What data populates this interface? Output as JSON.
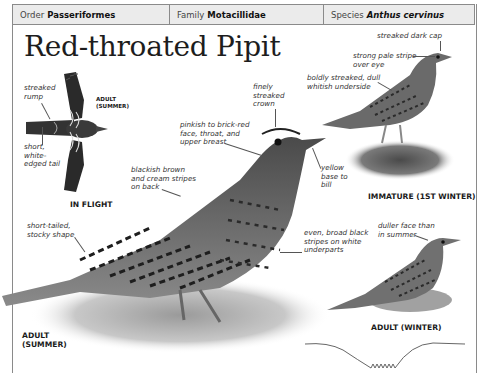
{
  "header": {
    "order_label": "Order",
    "order_value": "Passeriformes",
    "family_label": "Family",
    "family_value": "Motacillidae",
    "species_label": "Species",
    "species_value": "Anthus cervinus"
  },
  "title": "Red-throated Pipit",
  "flight_figure": {
    "caption": "IN FLIGHT",
    "age_label_line1": "ADULT",
    "age_label_line2": "(SUMMER)",
    "annotations": [
      {
        "line1": "streaked",
        "line2": "rump"
      },
      {
        "line1": "short,",
        "line2": "white-",
        "line3": "edged tail"
      }
    ]
  },
  "main_figure": {
    "caption_line1": "ADULT",
    "caption_line2": "(SUMMER)",
    "annotations": [
      {
        "line1": "finely",
        "line2": "streaked",
        "line3": "crown"
      },
      {
        "line1": "pinkish to brick-red",
        "line2": "face, throat, and",
        "line3": "upper breast"
      },
      {
        "line1": "blackish brown",
        "line2": "and cream stripes",
        "line3": "on back"
      },
      {
        "line1": "yellow",
        "line2": "base to",
        "line3": "bill"
      },
      {
        "line1": "short-tailed,",
        "line2": "stocky shape"
      },
      {
        "line1": "even, broad black",
        "line2": "stripes on white",
        "line3": "underparts"
      }
    ]
  },
  "immature_figure": {
    "caption": "IMMATURE (1ST WINTER)",
    "annotations": [
      {
        "line1": "streaked dark cap"
      },
      {
        "line1": "strong pale stripe",
        "line2": "over eye"
      },
      {
        "line1": "boldly streaked, dull",
        "line2": "whitish underside"
      }
    ]
  },
  "winter_figure": {
    "caption": "ADULT (WINTER)",
    "annotations": [
      {
        "line1": "duller face than",
        "line2": "in summer"
      }
    ]
  },
  "flight_pattern_icon": "undulating-flight-path"
}
